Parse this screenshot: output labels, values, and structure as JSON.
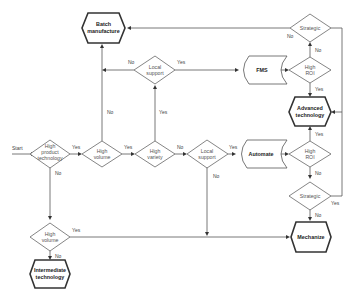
{
  "diagram": {
    "start_label": "Start",
    "nodes": {
      "batch": {
        "line1": "Batch",
        "line2": "manufacture"
      },
      "local_support_top": {
        "line1": "Local",
        "line2": "support"
      },
      "fms": {
        "label": "FMS"
      },
      "strategic_top": {
        "label": "Strategic"
      },
      "high_roi_top": {
        "line1": "High",
        "line2": "ROI"
      },
      "advanced": {
        "line1": "Advanced",
        "line2": "technology"
      },
      "high_product_tech": {
        "line1": "High",
        "line2": "product",
        "line3": "technology"
      },
      "high_volume_1": {
        "line1": "High",
        "line2": "volume"
      },
      "high_variety": {
        "line1": "High",
        "line2": "variety"
      },
      "local_support_mid": {
        "line1": "Local",
        "line2": "support"
      },
      "automate": {
        "label": "Automate"
      },
      "high_roi_bottom": {
        "line1": "High",
        "line2": "ROI"
      },
      "strategic_bottom": {
        "label": "Strategic"
      },
      "high_volume_2": {
        "line1": "High",
        "line2": "volume"
      },
      "intermediate": {
        "line1": "Intermediate",
        "line2": "technology"
      },
      "mechanize": {
        "label": "Mechanize"
      }
    },
    "edge_labels": {
      "yes": "Yes",
      "no": "No"
    }
  }
}
